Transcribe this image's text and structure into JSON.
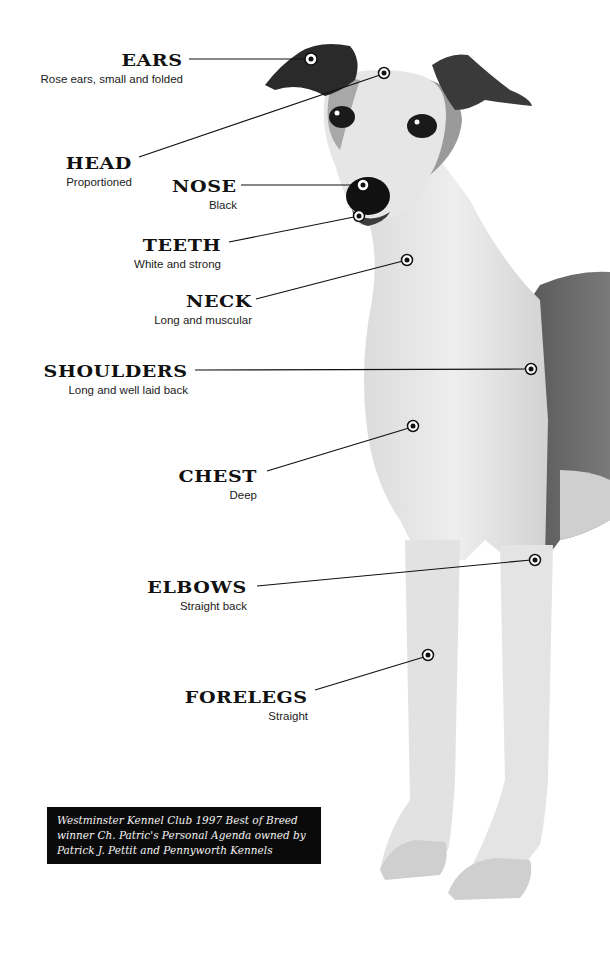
{
  "diagram": {
    "annotations": [
      {
        "id": "ears",
        "title": "EARS",
        "description": "Rose ears, small and folded"
      },
      {
        "id": "head",
        "title": "HEAD",
        "description": "Proportioned"
      },
      {
        "id": "nose",
        "title": "NOSE",
        "description": "Black"
      },
      {
        "id": "teeth",
        "title": "TEETH",
        "description": "White and strong"
      },
      {
        "id": "neck",
        "title": "NECK",
        "description": "Long and muscular"
      },
      {
        "id": "shoulders",
        "title": "SHOULDERS",
        "description": "Long and well laid back"
      },
      {
        "id": "chest",
        "title": "CHEST",
        "description": "Deep"
      },
      {
        "id": "elbows",
        "title": "ELBOWS",
        "description": "Straight back"
      },
      {
        "id": "forelegs",
        "title": "FORELEGS",
        "description": "Straight"
      }
    ],
    "caption": {
      "lines": [
        "Westminster Kennel Club 1997 Best of Breed",
        "winner Ch. Patric's Personal Agenda owned by",
        "Patrick J. Pettit and Pennyworth Kennels"
      ]
    },
    "colors": {
      "background": "#ffffff",
      "ink": "#111111",
      "caption_bg": "#0a0a0a",
      "caption_text": "#f2f2f2"
    }
  }
}
